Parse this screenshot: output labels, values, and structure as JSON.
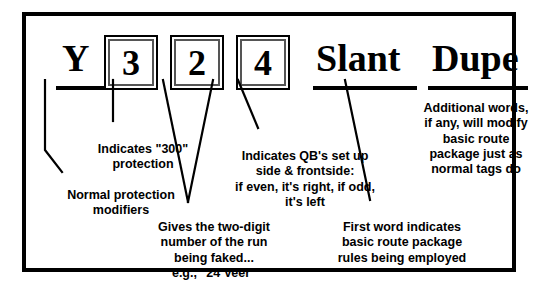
{
  "diagram": {
    "title_row": {
      "tag_y": "Y",
      "digits": [
        "3",
        "2",
        "4"
      ],
      "word_slant": "Slant",
      "word_dupe": "Dupe"
    },
    "annotations": {
      "normal_protection": "Normal protection\nmodifiers",
      "indicates_300": "Indicates \"300\"\nprotection",
      "qb_setup": "Indicates QB's set up\nside & frontside:\nif even, it's right, if odd,\nit's left",
      "two_digit_run": "Gives the two-digit\nnumber of the run\nbeing faked...\ne.g., \"24 Veer\"",
      "first_word": "First word indicates\nbasic route package\nrules being employed",
      "additional_words": "Additional words,\nif any, will modify\nbasic route\npackage just as\nnormal tags do"
    },
    "colors": {
      "ink": "#000000",
      "paper": "#ffffff",
      "box_inner_rule": "#555555"
    }
  }
}
